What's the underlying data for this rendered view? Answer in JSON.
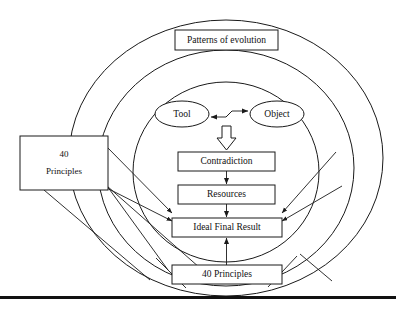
{
  "diagram": {
    "type": "concentric-circles-flow",
    "stroke_color": "#1a1a1a",
    "background_color": "#ffffff",
    "rings": [
      {
        "name": "outer-ring",
        "label": ""
      },
      {
        "name": "middle-ring",
        "label": ""
      },
      {
        "name": "inner-ring",
        "label": ""
      }
    ],
    "nodes": {
      "patterns_of_evolution": "Patterns of evolution",
      "tool": "Tool",
      "object": "Object",
      "contradiction": "Contradiction",
      "resources": "Resources",
      "ideal_final_result": "Ideal Final Result",
      "principles_bottom": "40 Principles",
      "principles_left_line1": "40",
      "principles_left_line2": "Principles"
    },
    "connections": [
      {
        "from": "tool",
        "to": "object",
        "style": "double-headed-arrow"
      },
      {
        "from": "tool-object",
        "to": "contradiction",
        "style": "block-arrow-down"
      },
      {
        "from": "contradiction",
        "to": "resources",
        "style": "arrow-down"
      },
      {
        "from": "resources",
        "to": "ideal_final_result",
        "style": "arrow-down"
      },
      {
        "from": "principles_bottom",
        "to": "ideal_final_result",
        "style": "arrow-up"
      },
      {
        "from": "principles_left",
        "to": "ideal_final_result",
        "style": "diagonal-arrow"
      },
      {
        "from": "right-ring",
        "to": "ideal_final_result",
        "style": "diagonal-arrow"
      }
    ],
    "footer_rule": true
  }
}
